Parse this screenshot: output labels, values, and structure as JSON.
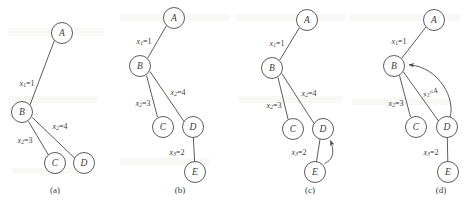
{
  "figure": {
    "width": 466,
    "height": 205,
    "background_color": "#ffffff",
    "ink_color": "#4a4a4a",
    "panels": [
      {
        "caption": "(a)",
        "caption_x": 55,
        "caption_y": 190,
        "nodes": [
          {
            "id": "A",
            "label": "A",
            "cx": 62,
            "cy": 33,
            "r": 10.5
          },
          {
            "id": "B",
            "label": "B",
            "cx": 22,
            "cy": 112,
            "r": 10.5
          },
          {
            "id": "C",
            "label": "C",
            "cx": 55,
            "cy": 163,
            "r": 10.5
          },
          {
            "id": "D",
            "label": "D",
            "cx": 84,
            "cy": 163,
            "r": 10.5
          }
        ],
        "edges": [
          {
            "from": "B",
            "to": "A",
            "label_var": "x",
            "label_sub": "1",
            "label_val": "1",
            "label_x": 27,
            "label_y": 83
          },
          {
            "from": "B",
            "to": "C",
            "label_var": "x",
            "label_sub": "2",
            "label_val": "3",
            "label_x": 25,
            "label_y": 140
          },
          {
            "from": "B",
            "to": "D",
            "label_var": "x",
            "label_sub": "2",
            "label_val": "4",
            "label_x": 60,
            "label_y": 126
          }
        ],
        "arrows": []
      },
      {
        "caption": "(b)",
        "caption_x": 180,
        "caption_y": 190,
        "nodes": [
          {
            "id": "A",
            "label": "A",
            "cx": 174,
            "cy": 18,
            "r": 10.5
          },
          {
            "id": "B",
            "label": "B",
            "cx": 140,
            "cy": 66,
            "r": 10.5
          },
          {
            "id": "C",
            "label": "C",
            "cx": 163,
            "cy": 127,
            "r": 10.5
          },
          {
            "id": "D",
            "label": "D",
            "cx": 193,
            "cy": 127,
            "r": 10.5
          },
          {
            "id": "E",
            "label": "E",
            "cx": 195,
            "cy": 172,
            "r": 10.5
          }
        ],
        "edges": [
          {
            "from": "B",
            "to": "A",
            "label_var": "x",
            "label_sub": "1",
            "label_val": "1",
            "label_x": 144,
            "label_y": 41
          },
          {
            "from": "B",
            "to": "C",
            "label_var": "x",
            "label_sub": "2",
            "label_val": "3",
            "label_x": 143,
            "label_y": 103
          },
          {
            "from": "B",
            "to": "D",
            "label_var": "x",
            "label_sub": "2",
            "label_val": "4",
            "label_x": 178,
            "label_y": 92
          },
          {
            "from": "D",
            "to": "E",
            "label_var": "x",
            "label_sub": "3",
            "label_val": "2",
            "label_x": 177,
            "label_y": 152
          }
        ],
        "arrows": []
      },
      {
        "caption": "(c)",
        "caption_x": 310,
        "caption_y": 190,
        "nodes": [
          {
            "id": "A",
            "label": "A",
            "cx": 307,
            "cy": 20,
            "r": 10.5
          },
          {
            "id": "B",
            "label": "B",
            "cx": 272,
            "cy": 68,
            "r": 10.5
          },
          {
            "id": "C",
            "label": "C",
            "cx": 293,
            "cy": 129,
            "r": 10.5
          },
          {
            "id": "D",
            "label": "D",
            "cx": 323,
            "cy": 129,
            "r": 10.5
          },
          {
            "id": "E",
            "label": "E",
            "cx": 315,
            "cy": 172,
            "r": 10.5
          }
        ],
        "edges": [
          {
            "from": "B",
            "to": "A",
            "label_var": "x",
            "label_sub": "1",
            "label_val": "1",
            "label_x": 277,
            "label_y": 43
          },
          {
            "from": "B",
            "to": "C",
            "label_var": "x",
            "label_sub": "2",
            "label_val": "3",
            "label_x": 274,
            "label_y": 105
          },
          {
            "from": "B",
            "to": "D",
            "label_var": "x",
            "label_sub": "2",
            "label_val": "4",
            "label_x": 309,
            "label_y": 93
          },
          {
            "from": "D",
            "to": "E",
            "label_var": "x",
            "label_sub": "3",
            "label_val": "2",
            "label_x": 299,
            "label_y": 152
          }
        ],
        "arrows": [
          {
            "from": "E",
            "to": "D",
            "description": "curved-backedge-E-to-D"
          }
        ]
      },
      {
        "caption": "(d)",
        "caption_x": 441,
        "caption_y": 190,
        "nodes": [
          {
            "id": "A",
            "label": "A",
            "cx": 434,
            "cy": 20,
            "r": 10.5
          },
          {
            "id": "B",
            "label": "B",
            "cx": 394,
            "cy": 66,
            "r": 10.5
          },
          {
            "id": "C",
            "label": "C",
            "cx": 416,
            "cy": 127,
            "r": 10.5
          },
          {
            "id": "D",
            "label": "D",
            "cx": 447,
            "cy": 127,
            "r": 10.5
          },
          {
            "id": "E",
            "label": "E",
            "cx": 448,
            "cy": 172,
            "r": 10.5
          }
        ],
        "edges": [
          {
            "from": "B",
            "to": "A",
            "label_var": "x",
            "label_sub": "1",
            "label_val": "1",
            "label_x": 399,
            "label_y": 41
          },
          {
            "from": "B",
            "to": "C",
            "label_var": "x",
            "label_sub": "2",
            "label_val": "3",
            "label_x": 396,
            "label_y": 103
          },
          {
            "from": "B",
            "to": "D",
            "label_var": "x",
            "label_sub": "2",
            "label_val": "4",
            "label_x": 430,
            "label_y": 92
          },
          {
            "from": "D",
            "to": "E",
            "label_var": "x",
            "label_sub": "3",
            "label_val": "2",
            "label_x": 431,
            "label_y": 152
          }
        ],
        "arrows": [
          {
            "from": "D",
            "to": "B",
            "description": "curved-backedge-D-to-B"
          }
        ]
      }
    ]
  }
}
